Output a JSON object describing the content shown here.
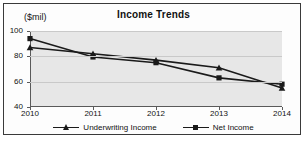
{
  "chart_data": {
    "type": "line",
    "title": "Income Trends",
    "xlabel": "",
    "ylabel": "($mil)",
    "categories": [
      "2010",
      "2011",
      "2012",
      "2013",
      "2014"
    ],
    "series": [
      {
        "name": "Underwriting Income",
        "marker": "triangle",
        "values": [
          87,
          82,
          77,
          71,
          55
        ]
      },
      {
        "name": "Net Income",
        "marker": "square",
        "values": [
          94,
          79.5,
          75,
          63,
          58
        ]
      }
    ],
    "yticks": [
      40,
      60,
      80,
      100
    ],
    "ylim": [
      40,
      100
    ],
    "grid": true,
    "legend_position": "bottom",
    "plot_background": "#e7e7e7",
    "line_color": "#1a1a1a"
  },
  "legend": {
    "items": [
      {
        "label": "Underwriting Income"
      },
      {
        "label": "Net Income"
      }
    ]
  }
}
